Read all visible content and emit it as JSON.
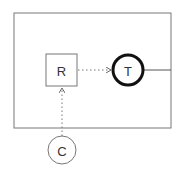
{
  "diagram": {
    "type": "block-diagram",
    "container": {
      "x": 14,
      "y": 13,
      "w": 157,
      "h": 115,
      "stroke": "#777777"
    },
    "nodes": [
      {
        "id": "R",
        "label": "R",
        "shape": "square",
        "x": 46,
        "y": 54,
        "w": 31,
        "h": 32,
        "stroke": "#777777",
        "stroke_width": 1
      },
      {
        "id": "T",
        "label": "T",
        "shape": "circle",
        "cx": 128,
        "cy": 70,
        "r": 15,
        "stroke": "#111111",
        "stroke_width": 3
      },
      {
        "id": "C",
        "label": "C",
        "shape": "circle",
        "cx": 62,
        "cy": 150,
        "r": 14,
        "stroke": "#777777",
        "stroke_width": 1
      }
    ],
    "edges": [
      {
        "from": "R",
        "to": "T",
        "style": "dotted",
        "arrow": "open",
        "x1": 78,
        "y1": 70,
        "x2": 111,
        "y2": 70
      },
      {
        "from": "C",
        "to": "R",
        "style": "dotted",
        "arrow": "open",
        "x1": 62,
        "y1": 136,
        "x2": 62,
        "y2": 88
      },
      {
        "from": "T",
        "to": "container-edge",
        "style": "solid",
        "arrow": "none",
        "x1": 143,
        "y1": 70,
        "x2": 171,
        "y2": 70
      }
    ]
  }
}
